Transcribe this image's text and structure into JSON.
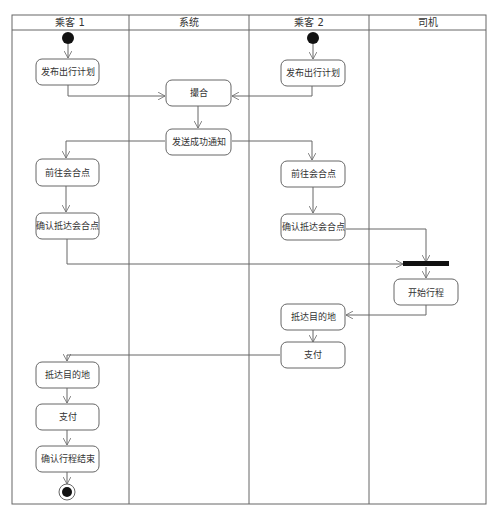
{
  "diagram": {
    "type": "UML activity diagram with swimlanes",
    "lanes": [
      {
        "id": "p1",
        "label": "乘客 1"
      },
      {
        "id": "sys",
        "label": "系统"
      },
      {
        "id": "p2",
        "label": "乘客 2"
      },
      {
        "id": "drv",
        "label": "司机"
      }
    ],
    "nodes": {
      "p1_publish": "发布出行计划",
      "p1_goto": "前往会合点",
      "p1_confirm_arrive": "确认抵达会合点",
      "p1_arrive_dest": "抵达目的地",
      "p1_pay": "支付",
      "p1_confirm_end": "确认行程结束",
      "sys_match": "撮合",
      "sys_notify": "发送成功通知",
      "p2_publish": "发布出行计划",
      "p2_goto": "前往会合点",
      "p2_confirm_arrive": "确认抵达会合点",
      "p2_arrive_dest": "抵达目的地",
      "p2_pay": "支付",
      "drv_start": "开始行程"
    },
    "special_nodes": [
      "initial-node-p1",
      "initial-node-p2",
      "join-bar",
      "final-node"
    ],
    "colors": {
      "line": "#666666",
      "fill": "#ffffff",
      "node_fill": "#111111"
    }
  }
}
